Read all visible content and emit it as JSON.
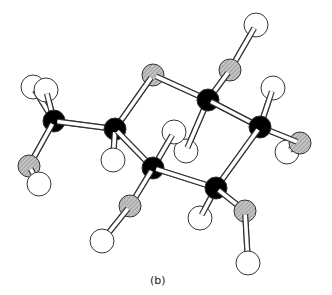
{
  "figure": {
    "caption": "(b)"
  },
  "legend_colors": {
    "carbon": "#000000",
    "oxygen": "#b4b4b4",
    "hydrogen": "#ffffff",
    "outline": "#333333"
  },
  "atoms": [
    {
      "id": "C1",
      "element": "C",
      "x": 54,
      "y": 121,
      "r": 11
    },
    {
      "id": "H1a",
      "element": "H",
      "x": 33,
      "y": 87,
      "r": 12
    },
    {
      "id": "H1b",
      "element": "H",
      "x": 46,
      "y": 90,
      "r": 12
    },
    {
      "id": "O1",
      "element": "O",
      "x": 29,
      "y": 166,
      "r": 11
    },
    {
      "id": "H1c",
      "element": "H",
      "x": 39,
      "y": 184,
      "r": 12
    },
    {
      "id": "C2",
      "element": "C",
      "x": 115,
      "y": 129,
      "r": 11
    },
    {
      "id": "H2",
      "element": "H",
      "x": 113,
      "y": 160,
      "r": 12
    },
    {
      "id": "O5",
      "element": "O",
      "x": 153,
      "y": 75,
      "r": 11
    },
    {
      "id": "C3",
      "element": "C",
      "x": 208,
      "y": 100,
      "r": 11
    },
    {
      "id": "O3",
      "element": "O",
      "x": 230,
      "y": 70,
      "r": 11
    },
    {
      "id": "H3",
      "element": "H",
      "x": 256,
      "y": 25,
      "r": 12
    },
    {
      "id": "C4",
      "element": "C",
      "x": 260,
      "y": 127,
      "r": 11
    },
    {
      "id": "H4",
      "element": "H",
      "x": 273,
      "y": 88,
      "r": 12
    },
    {
      "id": "H4o",
      "element": "H",
      "x": 287,
      "y": 152,
      "r": 12
    },
    {
      "id": "O4",
      "element": "O",
      "x": 300,
      "y": 143,
      "r": 11
    },
    {
      "id": "Hc1",
      "element": "H",
      "x": 186,
      "y": 151,
      "r": 12
    },
    {
      "id": "C5",
      "element": "C",
      "x": 153,
      "y": 168,
      "r": 11
    },
    {
      "id": "Hc2",
      "element": "H",
      "x": 174,
      "y": 132,
      "r": 12
    },
    {
      "id": "O2",
      "element": "O",
      "x": 130,
      "y": 206,
      "r": 11
    },
    {
      "id": "H2o",
      "element": "H",
      "x": 102,
      "y": 241,
      "r": 12
    },
    {
      "id": "H6",
      "element": "H",
      "x": 200,
      "y": 218,
      "r": 12
    },
    {
      "id": "C6",
      "element": "C",
      "x": 216,
      "y": 188,
      "r": 11
    },
    {
      "id": "O6",
      "element": "O",
      "x": 245,
      "y": 211,
      "r": 11
    },
    {
      "id": "H6o",
      "element": "H",
      "x": 248,
      "y": 263,
      "r": 12
    }
  ],
  "bonds": [
    [
      "C1",
      "H1a"
    ],
    [
      "C1",
      "H1b"
    ],
    [
      "C1",
      "O1"
    ],
    [
      "O1",
      "H1c"
    ],
    [
      "C1",
      "C2"
    ],
    [
      "C2",
      "H2"
    ],
    [
      "C2",
      "O5"
    ],
    [
      "C2",
      "C5"
    ],
    [
      "O5",
      "C3"
    ],
    [
      "C3",
      "O3"
    ],
    [
      "O3",
      "H3"
    ],
    [
      "C3",
      "C4"
    ],
    [
      "C3",
      "Hc1"
    ],
    [
      "C4",
      "H4"
    ],
    [
      "C4",
      "O4"
    ],
    [
      "O4",
      "H4o"
    ],
    [
      "C4",
      "C6"
    ],
    [
      "C5",
      "Hc2"
    ],
    [
      "C5",
      "O2"
    ],
    [
      "O2",
      "H2o"
    ],
    [
      "C5",
      "C6"
    ],
    [
      "C6",
      "H6"
    ],
    [
      "C6",
      "O6"
    ],
    [
      "O6",
      "H6o"
    ]
  ]
}
